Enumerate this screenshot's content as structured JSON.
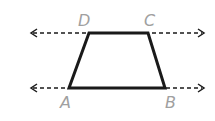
{
  "diagram": {
    "type": "trapezoid-with-parallel-lines",
    "labels": {
      "A": "A",
      "B": "B",
      "C": "C",
      "D": "D"
    },
    "vertices": {
      "A": [
        69,
        88
      ],
      "B": [
        165,
        88
      ],
      "C": [
        148,
        33
      ],
      "D": [
        89,
        33
      ]
    },
    "lines": [
      {
        "name": "line-DC",
        "y": 33,
        "x1": 30,
        "x2": 205,
        "style": "dashed",
        "arrows": "both"
      },
      {
        "name": "line-AB",
        "y": 88,
        "x1": 30,
        "x2": 205,
        "style": "dashed",
        "arrows": "both"
      }
    ],
    "colors": {
      "shape": "#1a1a1a",
      "dashed": "#1a1a1a",
      "label": "#a0a0a0"
    }
  }
}
